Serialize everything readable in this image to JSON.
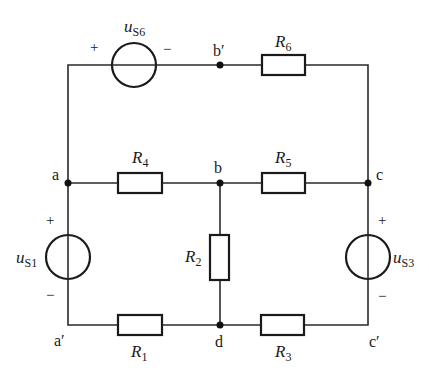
{
  "diagram": {
    "type": "circuit",
    "nodes": {
      "a": "a",
      "a_prime": "a′",
      "b": "b",
      "b_prime": "b′",
      "c": "c",
      "c_prime": "c′",
      "d": "d"
    },
    "sources": {
      "us6": {
        "base": "u",
        "sub": "S6",
        "plus": "+",
        "minus": "−"
      },
      "us1": {
        "base": "u",
        "sub": "S1",
        "plus": "+",
        "minus": "−"
      },
      "us3": {
        "base": "u",
        "sub": "S3",
        "plus": "+",
        "minus": "−"
      }
    },
    "resistors": {
      "r1": {
        "base": "R",
        "sub": "1"
      },
      "r2": {
        "base": "R",
        "sub": "2"
      },
      "r3": {
        "base": "R",
        "sub": "3"
      },
      "r4": {
        "base": "R",
        "sub": "4"
      },
      "r5": {
        "base": "R",
        "sub": "5"
      },
      "r6": {
        "base": "R",
        "sub": "6"
      }
    },
    "connections": [
      {
        "element": "uS6",
        "from": "a",
        "to": "b′",
        "polarity": "+ at a side"
      },
      {
        "element": "R6",
        "from": "b′",
        "to": "c"
      },
      {
        "element": "R4",
        "from": "a",
        "to": "b"
      },
      {
        "element": "R5",
        "from": "b",
        "to": "c"
      },
      {
        "element": "R2",
        "from": "b",
        "to": "d"
      },
      {
        "element": "uS1",
        "from": "a",
        "to": "a′",
        "polarity": "+ at top (a)"
      },
      {
        "element": "uS3",
        "from": "c",
        "to": "c′",
        "polarity": "+ at top (c)"
      },
      {
        "element": "R1",
        "from": "a′",
        "to": "d"
      },
      {
        "element": "R3",
        "from": "d",
        "to": "c′"
      }
    ]
  }
}
